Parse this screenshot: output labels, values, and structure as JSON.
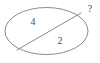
{
  "figure": {
    "type": "geometry-diagram",
    "canvas": {
      "width": 100,
      "height": 63,
      "background": "#ffffff"
    },
    "stroke_color": "#8a8a8a",
    "text_color": "#4a4a4a",
    "shapes": {
      "ellipse": {
        "name": "circle",
        "cx": 46.5,
        "cy": 31,
        "rx": 41.5,
        "ry": 23.5,
        "stroke": "#8a8a8a",
        "stroke_width": 1,
        "fill": "none"
      },
      "chord": {
        "name": "chord",
        "x1": 17,
        "y1": 50,
        "x2": 81,
        "y2": 13,
        "stroke": "#8a8a8a",
        "stroke_width": 1
      }
    },
    "labels": {
      "upper_left": "4",
      "lower_right": "2",
      "unknown": "?"
    }
  }
}
